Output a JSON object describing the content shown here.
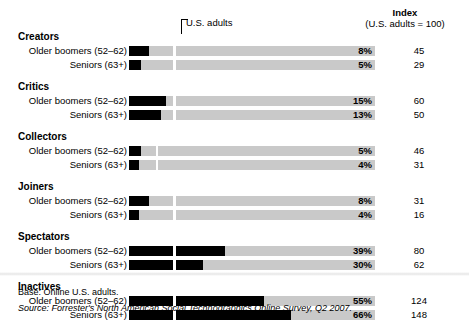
{
  "header": {
    "index_label": "Index",
    "index_sub": "(U.S. adults = 100)",
    "benchmark_note": "U.S. adults"
  },
  "footer": {
    "base": "Base: Online U.S. adults.",
    "source": "Source: Forrester's North American Social Technographics Online Survey, Q2 2007."
  },
  "chart_data": {
    "type": "bar",
    "title": "",
    "xlabel": "",
    "ylabel": "",
    "xlim": [
      0,
      100
    ],
    "grid": false,
    "orientation": "horizontal",
    "benchmark_label": "U.S. adults",
    "index_base": 100,
    "groups": [
      {
        "name": "Creators",
        "benchmark_pct": 18,
        "rows": [
          {
            "label": "Older boomers (52–62)",
            "pct": 8,
            "pct_text": "8%",
            "index": 45,
            "index_text": "45"
          },
          {
            "label": "Seniors (63+)",
            "pct": 5,
            "pct_text": "5%",
            "index": 29,
            "index_text": "29"
          }
        ]
      },
      {
        "name": "Critics",
        "benchmark_pct": 18,
        "rows": [
          {
            "label": "Older boomers (52–62)",
            "pct": 15,
            "pct_text": "15%",
            "index": 60,
            "index_text": "60"
          },
          {
            "label": "Seniors (63+)",
            "pct": 13,
            "pct_text": "13%",
            "index": 50,
            "index_text": "50"
          }
        ]
      },
      {
        "name": "Collectors",
        "benchmark_pct": 11,
        "rows": [
          {
            "label": "Older boomers (52–62)",
            "pct": 5,
            "pct_text": "5%",
            "index": 46,
            "index_text": "46"
          },
          {
            "label": "Seniors (63+)",
            "pct": 4,
            "pct_text": "4%",
            "index": 31,
            "index_text": "31"
          }
        ]
      },
      {
        "name": "Joiners",
        "benchmark_pct": 18,
        "rows": [
          {
            "label": "Older boomers (52–62)",
            "pct": 8,
            "pct_text": "8%",
            "index": 31,
            "index_text": "31"
          },
          {
            "label": "Seniors (63+)",
            "pct": 4,
            "pct_text": "4%",
            "index": 16,
            "index_text": "16"
          }
        ]
      },
      {
        "name": "Spectators",
        "benchmark_pct": 18,
        "rows": [
          {
            "label": "Older boomers (52–62)",
            "pct": 39,
            "pct_text": "39%",
            "index": 80,
            "index_text": "80"
          },
          {
            "label": "Seniors (63+)",
            "pct": 30,
            "pct_text": "30%",
            "index": 62,
            "index_text": "62"
          }
        ]
      },
      {
        "name": "Inactives",
        "benchmark_pct": 18,
        "rows": [
          {
            "label": "Older boomers (52–62)",
            "pct": 55,
            "pct_text": "55%",
            "index": 124,
            "index_text": "124"
          },
          {
            "label": "Seniors (63+)",
            "pct": 66,
            "pct_text": "66%",
            "index": 148,
            "index_text": "148"
          }
        ]
      }
    ]
  }
}
